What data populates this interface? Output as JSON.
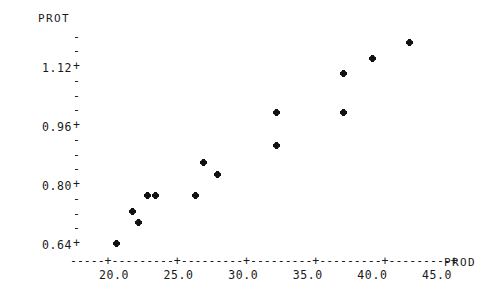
{
  "chart_data": {
    "type": "scatter",
    "title": "",
    "xlabel": "PROD",
    "ylabel": "PROT",
    "xlim": [
      17.0,
      46.5
    ],
    "ylim": [
      0.6,
      1.235
    ],
    "grid": false,
    "legend": null,
    "marker": "*",
    "x_ticks": [
      {
        "value": 20.0,
        "label": "20.0"
      },
      {
        "value": 25.0,
        "label": "25.0"
      },
      {
        "value": 30.0,
        "label": "30.0"
      },
      {
        "value": 35.0,
        "label": "35.0"
      },
      {
        "value": 40.0,
        "label": "40.0"
      },
      {
        "value": 45.0,
        "label": "45.0"
      }
    ],
    "y_ticks": [
      {
        "value": 1.12,
        "label": "1.12",
        "major": true
      },
      {
        "value": 0.96,
        "label": "0.96",
        "major": true
      },
      {
        "value": 0.8,
        "label": "0.80",
        "major": true
      },
      {
        "value": 0.64,
        "label": "0.64",
        "major": true
      }
    ],
    "y_minor_ticks": [
      1.2,
      1.16,
      1.08,
      1.04,
      1.0,
      0.92,
      0.88,
      0.84,
      0.76,
      0.72,
      0.68
    ],
    "points": [
      {
        "x": 20.2,
        "y": 0.645
      },
      {
        "x": 21.4,
        "y": 0.732
      },
      {
        "x": 21.9,
        "y": 0.702
      },
      {
        "x": 22.6,
        "y": 0.773
      },
      {
        "x": 23.2,
        "y": 0.773
      },
      {
        "x": 26.3,
        "y": 0.773
      },
      {
        "x": 26.9,
        "y": 0.865
      },
      {
        "x": 28.0,
        "y": 0.83
      },
      {
        "x": 32.6,
        "y": 0.999
      },
      {
        "x": 32.6,
        "y": 0.91
      },
      {
        "x": 37.8,
        "y": 1.104
      },
      {
        "x": 37.8,
        "y": 1.0
      },
      {
        "x": 40.0,
        "y": 1.147
      },
      {
        "x": 42.9,
        "y": 1.19
      }
    ],
    "axis_line_dash": "-------+-------+-------+-------+-------+-------+",
    "tick_dash": "-",
    "tick_cross": "+"
  },
  "axis": {
    "y_title": "PROT",
    "x_title": "PROD",
    "x_dashes": "-----+---------+---------+---------+---------+---------+"
  }
}
